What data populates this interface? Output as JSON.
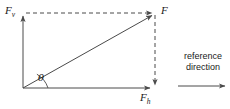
{
  "figure": {
    "type": "vector-force-diagram",
    "background_color": "#ffffff",
    "line_color": "#4a4a4a",
    "text_color": "#1a1a1a"
  },
  "labels": {
    "vertical_component": "F",
    "vertical_component_sub": "v",
    "horizontal_component": "F",
    "horizontal_component_sub": "h",
    "resultant": "F",
    "angle": "θ"
  },
  "reference": {
    "line1": "reference",
    "line2": "direction"
  },
  "geometry": {
    "origin": {
      "x": 23,
      "y": 88
    },
    "horizontal_tip": {
      "x": 153,
      "y": 88
    },
    "vertical_tip": {
      "x": 23,
      "y": 13
    },
    "resultant_tip": {
      "x": 155,
      "y": 13
    },
    "reference_arrow_start": {
      "x": 178,
      "y": 86
    },
    "reference_arrow_end": {
      "x": 228,
      "y": 86
    },
    "angle_arc_radius": 22
  }
}
